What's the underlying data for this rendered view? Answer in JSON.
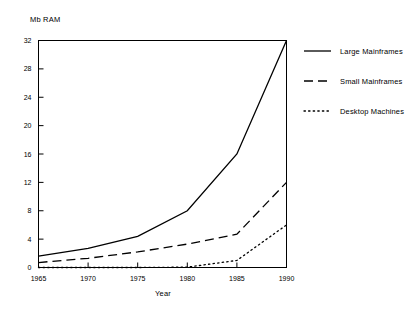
{
  "chart_data": {
    "type": "line",
    "title": "",
    "subtitle": "",
    "xlabel": "Year",
    "ylabel": "Mb RAM",
    "x": [
      1965,
      1970,
      1975,
      1980,
      1985,
      1990
    ],
    "xlim": [
      1965,
      1990
    ],
    "ylim": [
      0,
      32
    ],
    "xticks": [
      1965,
      1970,
      1975,
      1980,
      1985,
      1990
    ],
    "xtick_labels": [
      "1965",
      "1970",
      "1975",
      "1980",
      "1985",
      "1990"
    ],
    "yticks": [
      0,
      4,
      8,
      12,
      16,
      20,
      24,
      28,
      32
    ],
    "ytick_labels": [
      "0",
      "4",
      "8",
      "12",
      "16",
      "20",
      "24",
      "28",
      "32"
    ],
    "grid": false,
    "legend_position": "right",
    "series": [
      {
        "name": "Large Mainframes",
        "style": "solid",
        "color": "#000000",
        "values": [
          1.6,
          2.7,
          4.4,
          8.0,
          16.0,
          32.0
        ]
      },
      {
        "name": "Small Mainframes",
        "style": "dashed",
        "color": "#000000",
        "values": [
          0.7,
          1.3,
          2.2,
          3.3,
          4.7,
          12.0
        ]
      },
      {
        "name": "Desktop Machines",
        "style": "dotted",
        "color": "#000000",
        "values": [
          0.0,
          0.0,
          0.0,
          0.05,
          1.0,
          6.0
        ]
      }
    ]
  },
  "axis": {
    "y_label": "Mb RAM",
    "x_label": "Year"
  },
  "legend": {
    "items": [
      {
        "label": "Large Mainframes",
        "style": "solid"
      },
      {
        "label": "Small Mainframes",
        "style": "dashed"
      },
      {
        "label": "Desktop Machines",
        "style": "dotted"
      }
    ]
  },
  "colors": {
    "ink": "#000000",
    "background": "#ffffff"
  }
}
